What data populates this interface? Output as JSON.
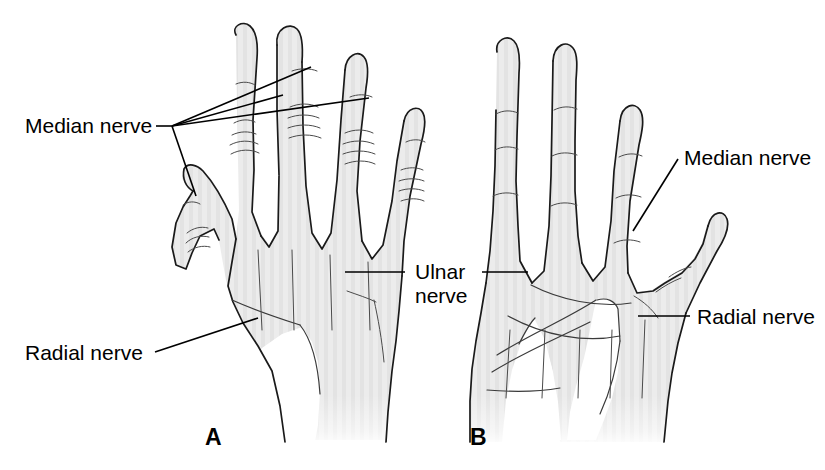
{
  "figure": {
    "background_color": "#ffffff",
    "skin_fill_color": "#ebebeb",
    "outline_color": "#1a1a1a",
    "label_color": "#000000",
    "width": 825,
    "height": 470
  },
  "panels": [
    {
      "letter": "A",
      "view": "dorsal",
      "letter_x": 205,
      "letter_y": 445
    },
    {
      "letter": "B",
      "view": "palmar",
      "letter_x": 470,
      "letter_y": 445
    }
  ],
  "labels": {
    "median_left": {
      "text": "Median nerve",
      "x": 25,
      "y": 133,
      "anchor": "start"
    },
    "radial_left": {
      "text": "Radial nerve",
      "x": 25,
      "y": 360,
      "anchor": "start"
    },
    "ulnar_line1": {
      "text": "Ulnar",
      "x": 415,
      "y": 279,
      "anchor": "start"
    },
    "ulnar_line2": {
      "text": "nerve",
      "x": 415,
      "y": 303,
      "anchor": "start"
    },
    "median_right": {
      "text": "Median nerve",
      "x": 684,
      "y": 165,
      "anchor": "start"
    },
    "radial_right": {
      "text": "Radial nerve",
      "x": 697,
      "y": 324,
      "anchor": "start"
    }
  },
  "leader_lines": [
    {
      "name": "median-left-stem",
      "points": "156,126 172,126"
    },
    {
      "name": "median-to-index",
      "points": "172,126 282,95"
    },
    {
      "name": "median-to-middle",
      "points": "172,126 310,67"
    },
    {
      "name": "median-to-ring",
      "points": "172,126 368,98"
    },
    {
      "name": "median-to-thumb",
      "points": "172,126 196,196"
    },
    {
      "name": "radial-left",
      "points": "155,352 258,318"
    },
    {
      "name": "ulnar-to-panel-a",
      "points": "345,272 405,272"
    },
    {
      "name": "ulnar-to-panel-b",
      "points": "482,272 528,272"
    },
    {
      "name": "median-right",
      "points": "633,231 678,159"
    },
    {
      "name": "radial-right",
      "points": "638,316 690,316"
    }
  ]
}
